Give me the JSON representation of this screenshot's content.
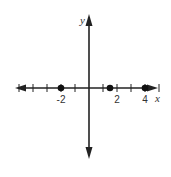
{
  "figure": {
    "type": "number-plane-with-points",
    "x_axis_label": "x",
    "y_axis_label": "y",
    "tick_labels": [
      {
        "value": -2,
        "text": "-2"
      },
      {
        "value": 2,
        "text": "2"
      },
      {
        "value": 4,
        "text": "4"
      }
    ],
    "tick_values": [
      -5,
      -4,
      -3,
      -2,
      -1,
      1,
      2,
      3,
      4,
      5
    ],
    "points": [
      {
        "x": -2,
        "label": "point at -2"
      },
      {
        "x": 1.5,
        "label": "point at 1.5"
      },
      {
        "x": 4,
        "label": "point at 4"
      }
    ],
    "colors": {
      "line": "#222222",
      "text": "#333333",
      "background": "#ffffff"
    }
  }
}
